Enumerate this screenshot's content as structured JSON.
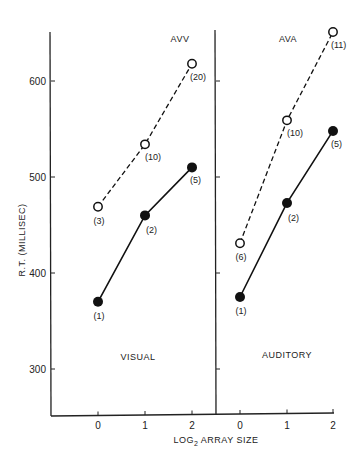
{
  "chart_data": {
    "type": "line",
    "ylabel": "R.T. (MILLISEC)",
    "xlabel": "LOG2 ARRAY SIZE",
    "xlabel_main": "LOG",
    "xlabel_sub": "2",
    "xlabel_rest": " ARRAY SIZE",
    "ylim": [
      250,
      650
    ],
    "yticks": [
      300,
      400,
      500,
      600
    ],
    "ytick_labels": [
      "300",
      "400",
      "500",
      "600"
    ],
    "grid": false,
    "panels": [
      {
        "name": "Visual",
        "bottom_label": "VISUAL",
        "top_label": "AVV",
        "x": [
          0,
          1,
          2
        ],
        "xtick_labels": [
          "0",
          "1",
          "2"
        ],
        "series": [
          {
            "name": "AVV (open, dashed)",
            "marker": "open-circle",
            "style": "dashed",
            "values": [
              469,
              534,
              618
            ],
            "n_labels": [
              "(3)",
              "(10)",
              "(20)"
            ]
          },
          {
            "name": "filled (solid)",
            "marker": "filled-circle",
            "style": "solid",
            "values": [
              370,
              460,
              510
            ],
            "n_labels": [
              "(1)",
              "(2)",
              "(5)"
            ]
          }
        ]
      },
      {
        "name": "Auditory",
        "bottom_label": "AUDITORY",
        "top_label": "AVA",
        "x": [
          0,
          1,
          2
        ],
        "xtick_labels": [
          "0",
          "1",
          "2"
        ],
        "series": [
          {
            "name": "AVA (open, dashed)",
            "marker": "open-circle",
            "style": "dashed",
            "values": [
              431,
              559,
              651
            ],
            "n_labels": [
              "(6)",
              "(10)",
              "(11)"
            ]
          },
          {
            "name": "filled (solid)",
            "marker": "filled-circle",
            "style": "solid",
            "values": [
              375,
              473,
              548
            ],
            "n_labels": [
              "(1)",
              "(2)",
              "(5)"
            ]
          }
        ]
      }
    ]
  }
}
